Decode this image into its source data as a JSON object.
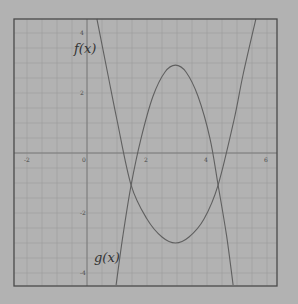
{
  "chart_data": {
    "type": "line",
    "title": "",
    "xlabel": "",
    "ylabel": "",
    "xlim": [
      -2.45,
      6.33
    ],
    "ylim": [
      -4.43,
      4.47
    ],
    "grid": true,
    "grid_step": 0.5,
    "x_ticks": [
      -2,
      0,
      2,
      4,
      6
    ],
    "x_tick_labels": [
      "-2",
      "0",
      "2",
      "4",
      "6"
    ],
    "y_ticks": [
      4,
      2,
      -2,
      -4
    ],
    "y_tick_labels": [
      "4",
      "2",
      "-2",
      "-4"
    ],
    "series": [
      {
        "name": "f(x)",
        "label": "f(x)",
        "shape": "upward parabola-like curve, vertex near (2.95, -3)",
        "x": [
          0.33,
          0.7,
          1.0,
          1.47,
          2.0,
          2.5,
          2.95,
          3.4,
          3.9,
          4.37,
          4.9,
          5.2,
          5.63
        ],
        "y": [
          4.47,
          2.6,
          1.1,
          -1.07,
          -2.2,
          -2.8,
          -3.0,
          -2.8,
          -2.2,
          -1.07,
          1.1,
          2.6,
          4.47
        ]
      },
      {
        "name": "g(x)",
        "label": "g(x)",
        "shape": "downward parabola, vertex near (2.95, 2.93)",
        "x": [
          0.97,
          1.2,
          1.47,
          1.8,
          2.2,
          2.6,
          2.95,
          3.3,
          3.7,
          4.1,
          4.37,
          4.65,
          4.87
        ],
        "y": [
          -4.4,
          -2.74,
          -1.07,
          0.48,
          1.89,
          2.7,
          2.93,
          2.7,
          1.89,
          0.48,
          -1.07,
          -2.74,
          -4.4
        ]
      }
    ],
    "intersections": [
      {
        "x": 1.47,
        "y": -1.07
      },
      {
        "x": 4.37,
        "y": -1.07
      }
    ],
    "annotations": [
      {
        "text": "f(x)",
        "x": 0.0,
        "y": 4.0
      },
      {
        "text": "g(x)",
        "x": 0.5,
        "y": -3.4
      }
    ]
  },
  "labels": {
    "f": "f(x)",
    "g": "g(x)"
  },
  "colors": {
    "background": "#b2b2b2",
    "frame": "#4a4a4a",
    "grid": "#9a9a9a",
    "axis": "#7a7a7a",
    "curve": "#606060"
  }
}
